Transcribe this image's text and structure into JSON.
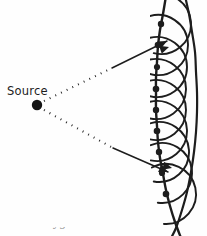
{
  "figure": {
    "background_color": "#fefefe",
    "ink_color": "#1d1d1d",
    "width": 207,
    "height": 236
  },
  "labels": {
    "source": "Source",
    "clipped_caption": "Huygens"
  },
  "source_point": {
    "name": "point-source",
    "x": 37,
    "y": 105,
    "radius": 5.2,
    "color": "#141414"
  },
  "rays": [
    {
      "name": "upper-ray",
      "style": "dotted-then-solid",
      "from": [
        44,
        101
      ],
      "dot_end": [
        112,
        68
      ],
      "to": [
        167,
        41
      ],
      "arrow": true
    },
    {
      "name": "lower-ray",
      "style": "dotted-then-solid",
      "from": [
        44,
        110
      ],
      "dot_end": [
        113,
        148
      ],
      "to": [
        168,
        172
      ],
      "arrow": true
    }
  ],
  "wavefront": {
    "name": "primary-wavefront-arc",
    "stroke_width": 2.4,
    "points": [
      [
        166,
        -4
      ],
      [
        163,
        14
      ],
      [
        160,
        30
      ],
      [
        158,
        46
      ],
      [
        157,
        62
      ],
      [
        156,
        78
      ],
      [
        156,
        94
      ],
      [
        156,
        110
      ],
      [
        157,
        126
      ],
      [
        158,
        142
      ],
      [
        160,
        158
      ],
      [
        163,
        174
      ],
      [
        166,
        190
      ],
      [
        170,
        206
      ],
      [
        175,
        222
      ],
      [
        181,
        238
      ]
    ]
  },
  "envelope": {
    "name": "secondary-envelope-arc",
    "stroke_width": 2.2,
    "points": [
      [
        185,
        -4
      ],
      [
        189,
        14
      ],
      [
        192,
        32
      ],
      [
        195,
        52
      ],
      [
        196,
        72
      ],
      [
        197,
        92
      ],
      [
        197,
        112
      ],
      [
        196,
        132
      ],
      [
        194,
        152
      ],
      [
        191,
        172
      ],
      [
        187,
        192
      ],
      [
        182,
        210
      ],
      [
        176,
        228
      ],
      [
        170,
        240
      ]
    ]
  },
  "wavelet_centers": [
    {
      "name": "wavelet-center-1",
      "x": 161,
      "y": 24,
      "r": 3.2
    },
    {
      "name": "wavelet-center-2",
      "x": 158,
      "y": 45,
      "r": 3.3
    },
    {
      "name": "wavelet-center-3",
      "x": 157,
      "y": 67,
      "r": 3.1
    },
    {
      "name": "wavelet-center-4",
      "x": 156,
      "y": 89,
      "r": 3.3
    },
    {
      "name": "wavelet-center-5",
      "x": 156,
      "y": 110,
      "r": 3.2
    },
    {
      "name": "wavelet-center-6",
      "x": 157,
      "y": 131,
      "r": 3.3
    },
    {
      "name": "wavelet-center-7",
      "x": 159,
      "y": 152,
      "r": 3.2
    },
    {
      "name": "wavelet-center-8",
      "x": 162,
      "y": 173,
      "r": 3.1
    },
    {
      "name": "wavelet-center-9",
      "x": 166,
      "y": 194,
      "r": 3.3
    }
  ],
  "wavelets": [
    {
      "name": "wavelet-arc-1",
      "cx": 161,
      "cy": 24,
      "r": 30,
      "a0": -112,
      "a1": 104
    },
    {
      "name": "wavelet-arc-2",
      "cx": 158,
      "cy": 45,
      "r": 30,
      "a0": -110,
      "a1": 106
    },
    {
      "name": "wavelet-arc-3",
      "cx": 157,
      "cy": 67,
      "r": 30,
      "a0": -108,
      "a1": 108
    },
    {
      "name": "wavelet-arc-4",
      "cx": 156,
      "cy": 89,
      "r": 30,
      "a0": -106,
      "a1": 108
    },
    {
      "name": "wavelet-arc-5",
      "cx": 156,
      "cy": 110,
      "r": 30,
      "a0": -104,
      "a1": 104
    },
    {
      "name": "wavelet-arc-6",
      "cx": 157,
      "cy": 131,
      "r": 30,
      "a0": -106,
      "a1": 102
    },
    {
      "name": "wavelet-arc-7",
      "cx": 159,
      "cy": 152,
      "r": 30,
      "a0": -108,
      "a1": 100
    },
    {
      "name": "wavelet-arc-8",
      "cx": 162,
      "cy": 173,
      "r": 30,
      "a0": -112,
      "a1": 98
    },
    {
      "name": "wavelet-arc-9",
      "cx": 166,
      "cy": 194,
      "r": 30,
      "a0": -118,
      "a1": 94
    }
  ],
  "arrowheads": [
    {
      "name": "arrowhead-upper-ray",
      "x": 167,
      "y": 41,
      "angle": -27,
      "size": 9
    },
    {
      "name": "arrowhead-lower-ray",
      "x": 168,
      "y": 172,
      "angle": 24,
      "size": 9
    },
    {
      "name": "arrowhead-wavefront-upper",
      "x": 169,
      "y": 47,
      "angle": -18,
      "size": 9
    },
    {
      "name": "arrowhead-wavefront-lower",
      "x": 172,
      "y": 168,
      "angle": 14,
      "size": 9
    }
  ]
}
